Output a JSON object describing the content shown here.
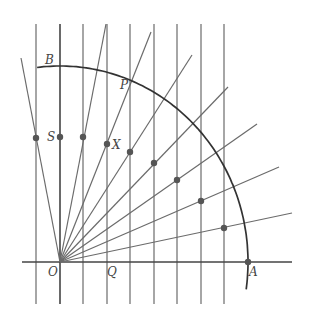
{
  "figure": {
    "colors": {
      "line": "#6b6b6b",
      "axis": "#444444",
      "arc": "#333333",
      "dot": "#555555"
    },
    "origin": {
      "x": 60,
      "y": 262
    },
    "arc": {
      "rx": 188,
      "ry": 196
    },
    "vertical_lines_x": [
      36,
      60,
      83,
      107,
      130,
      154,
      177,
      201,
      224
    ],
    "vertical_top": 24,
    "vertical_bottom": 304,
    "axis": {
      "x1": 22,
      "x2": 292,
      "y": 262
    },
    "rays": [
      {
        "end": [
          21,
          58
        ]
      },
      {
        "end": [
          106,
          24
        ]
      },
      {
        "end": [
          151,
          32
        ]
      },
      {
        "end": [
          192,
          55
        ]
      },
      {
        "end": [
          228,
          87
        ]
      },
      {
        "end": [
          257,
          124
        ]
      },
      {
        "end": [
          279,
          167
        ]
      },
      {
        "end": [
          292,
          213
        ]
      }
    ],
    "dots": [
      [
        36,
        138
      ],
      [
        60,
        137
      ],
      [
        83,
        137
      ],
      [
        107,
        144
      ],
      [
        130,
        152
      ],
      [
        154,
        163
      ],
      [
        177,
        180
      ],
      [
        201,
        201
      ],
      [
        224,
        228
      ],
      [
        248,
        262
      ]
    ],
    "labels": {
      "B": "B",
      "P": "P",
      "S": "S",
      "X": "X",
      "O": "O",
      "Q": "Q",
      "A": "A"
    }
  }
}
